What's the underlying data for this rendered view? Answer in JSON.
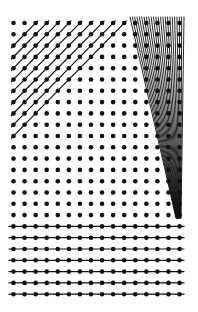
{
  "figure": {
    "width": 198,
    "height": 312,
    "background": "#ffffff",
    "ink": "#111111",
    "grid": {
      "columns": 16,
      "rows": 25,
      "x0": 13.5,
      "y0": 23,
      "dx": 11.07,
      "dy": 11.3,
      "dot_radius": 2.3
    },
    "diagonal_region": {
      "description": "45-degree lines through dots where col + row = k",
      "k_values": [
        2,
        3,
        4,
        5,
        6,
        7,
        8,
        9,
        10
      ],
      "stroke_width": 1.2,
      "extend": 3
    },
    "wedge_region": {
      "description": "dense steep lines converging to a point",
      "top_y": 17,
      "top_x_start": 130,
      "top_x_end": 184,
      "line_count": 24,
      "converge_x_start": 176,
      "converge_x_end": 181,
      "converge_y": 218,
      "stroke_width": 0.9
    },
    "horizontal_region": {
      "description": "horizontal lines through bottom rows",
      "rows": [
        18,
        19,
        20,
        21,
        22,
        23,
        24
      ],
      "x_start": 9,
      "x_end": 184,
      "stroke_width": 1.2
    }
  }
}
